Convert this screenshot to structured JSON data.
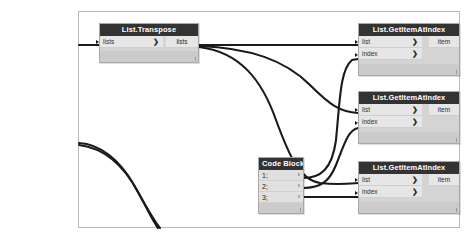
{
  "app": {
    "canvas_name": "dynamo-node-graph-canvas"
  },
  "nodes": {
    "transpose": {
      "title": "List.Transpose",
      "input_label": "lists",
      "output_label": "lists",
      "chevron": "❯"
    },
    "get_item_1": {
      "title": "List.GetItemAtIndex",
      "input_list_label": "list",
      "input_index_label": "index",
      "output_label": "item",
      "chevron": "❯"
    },
    "get_item_2": {
      "title": "List.GetItemAtIndex",
      "input_list_label": "list",
      "input_index_label": "index",
      "output_label": "item",
      "chevron": "❯"
    },
    "get_item_3": {
      "title": "List.GetItemAtIndex",
      "input_list_label": "list",
      "input_index_label": "index",
      "output_label": "item",
      "chevron": "❯"
    },
    "code_block": {
      "title": "Code Block",
      "lines": [
        {
          "text": "1;",
          "chevron": "›"
        },
        {
          "text": "2;",
          "chevron": "›"
        },
        {
          "text": "3;",
          "chevron": "›"
        }
      ]
    }
  },
  "colors": {
    "node_header": "#333333",
    "node_body": "#d4d4d4",
    "port_fill": "#e6e6e6",
    "wire": "#1a1a1a",
    "canvas_border": "#b9b9b9",
    "background": "#ffffff"
  }
}
